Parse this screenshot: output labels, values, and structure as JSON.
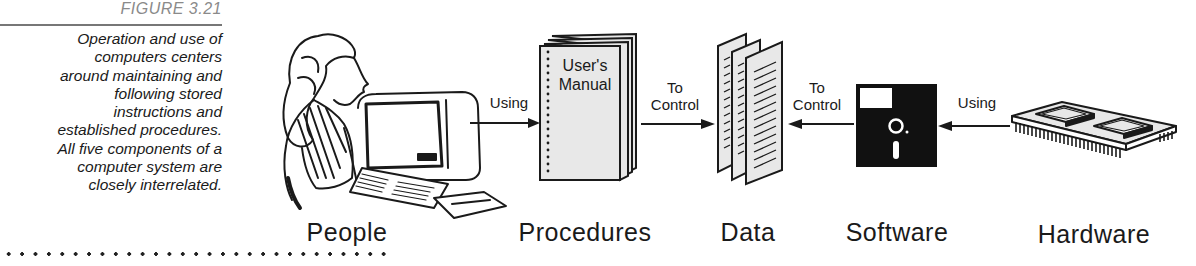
{
  "figure": {
    "number": "FIGURE 3.21",
    "caption": "Operation and use of\ncomputers centers\naround maintaining and\nfollowing stored\ninstructions and\nestablished procedures.\nAll five components of a\ncomputer system are\nclosely interrelated."
  },
  "components": [
    {
      "id": "people",
      "label": "People",
      "icon": "person-at-computer-icon"
    },
    {
      "id": "procedures",
      "label": "Procedures",
      "icon": "manual-book-icon",
      "book_title_line1": "User's",
      "book_title_line2": "Manual"
    },
    {
      "id": "data",
      "label": "Data",
      "icon": "documents-icon"
    },
    {
      "id": "software",
      "label": "Software",
      "icon": "floppy-disk-icon"
    },
    {
      "id": "hardware",
      "label": "Hardware",
      "icon": "circuit-board-icon"
    }
  ],
  "arrows": [
    {
      "from": "people",
      "to": "procedures",
      "label": "Using",
      "direction": "right"
    },
    {
      "from": "procedures",
      "to": "data",
      "label_line1": "To",
      "label_line2": "Control",
      "direction": "right"
    },
    {
      "from": "software",
      "to": "data",
      "label_line1": "To",
      "label_line2": "Control",
      "direction": "left"
    },
    {
      "from": "hardware",
      "to": "software",
      "label": "Using",
      "direction": "left"
    }
  ],
  "colors": {
    "ink": "#1a1a1a",
    "paper_fill": "#e8e8e8",
    "figure_number": "#8a8a8a"
  }
}
